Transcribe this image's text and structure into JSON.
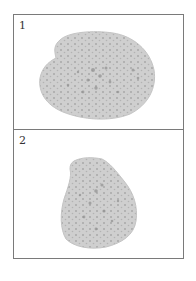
{
  "figure": {
    "panels": [
      {
        "label": "1",
        "description": "bone cross-section specimen"
      },
      {
        "label": "2",
        "description": "bone cross-section specimen"
      }
    ],
    "colors": {
      "border": "#7a7a7a",
      "specimen_fill": "#cfcfcf",
      "specimen_pores": "#9a9a9a",
      "background": "#ffffff"
    }
  }
}
